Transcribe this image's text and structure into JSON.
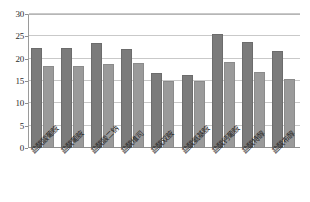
{
  "chart_data": {
    "type": "bar",
    "title": "",
    "subtitle": "",
    "xlabel": "",
    "ylabel": "",
    "ylim": [
      0,
      30
    ],
    "yticks": [
      0,
      5,
      10,
      15,
      20,
      25,
      30
    ],
    "ytick_labels": [
      "0",
      "5",
      "10",
      "15",
      "20",
      "25",
      "30"
    ],
    "grid": true,
    "legend": "none",
    "categories": [
      "盐酸酸葡胺",
      "盐酸葡胺",
      "盐酸酸二钠",
      "盐酸维司",
      "盐酸双胺",
      "盐酸氨基胺",
      "盐酸钙葡胺",
      "盐酸特醇",
      "盐酸布醇"
    ],
    "series": [
      {
        "name": "series-a",
        "color": "#7b7b7b",
        "values": [
          22.5,
          22.5,
          23.4,
          22.1,
          16.9,
          16.4,
          25.5,
          23.7,
          21.8
        ]
      },
      {
        "name": "series-b",
        "color": "#9a9a9a",
        "values": [
          18.4,
          18.4,
          18.7,
          19.0,
          15.0,
          15.0,
          19.3,
          17.1,
          15.4
        ]
      }
    ]
  }
}
